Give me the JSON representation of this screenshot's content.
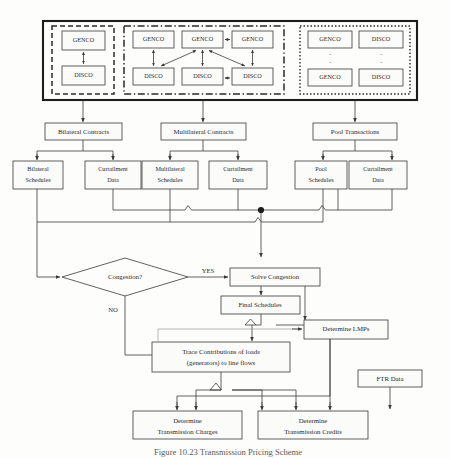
{
  "figure": {
    "caption": "Figure 10.23 Transmission Pricing Scheme",
    "background_color": "#fdfdfc",
    "line_color": "#3a3a3a",
    "box_fill": "#fbfbfa",
    "text_color": "#2a2a2a"
  },
  "top_panel": {
    "border_style": "solid-thick",
    "groups": [
      {
        "id": "bilateral-group",
        "border_style": "dashed",
        "nodes": [
          {
            "id": "bi-genco",
            "label": "GENCO"
          },
          {
            "id": "bi-disco",
            "label": "DISCO"
          }
        ]
      },
      {
        "id": "multilateral-group",
        "border_style": "dash-dot",
        "nodes": [
          {
            "id": "ml-genco-1",
            "label": "GENCO"
          },
          {
            "id": "ml-genco-2",
            "label": "GENCO"
          },
          {
            "id": "ml-genco-3",
            "label": "GENCO"
          },
          {
            "id": "ml-disco-1",
            "label": "DISCO"
          },
          {
            "id": "ml-disco-2",
            "label": "DISCO"
          },
          {
            "id": "ml-disco-3",
            "label": "DISCO"
          }
        ]
      },
      {
        "id": "pool-group",
        "border_style": "dotted",
        "vertical_ellipsis": ".",
        "nodes": [
          {
            "id": "pl-genco-1",
            "label": "GENCO"
          },
          {
            "id": "pl-disco-1",
            "label": "DISCO"
          },
          {
            "id": "pl-genco-2",
            "label": "GENCO"
          },
          {
            "id": "pl-disco-2",
            "label": "DISCO"
          }
        ]
      }
    ]
  },
  "contracts_row": [
    {
      "id": "bilateral-contracts",
      "label": "Bilateral Contracts"
    },
    {
      "id": "multilateral-contracts",
      "label": "Multilateral Contracts"
    },
    {
      "id": "pool-transactions",
      "label": "Pool Transactions"
    }
  ],
  "schedules_row": [
    {
      "id": "bilateral-schedules",
      "line1": "Bilateral",
      "line2": "Schedules"
    },
    {
      "id": "bilateral-curtailment",
      "line1": "Curtailment",
      "line2": "Data"
    },
    {
      "id": "multilateral-schedules",
      "line1": "Multilateral",
      "line2": "Schedules"
    },
    {
      "id": "multilateral-curtailment",
      "line1": "Curtailment",
      "line2": "Data"
    },
    {
      "id": "pool-schedules",
      "line1": "Pool",
      "line2": "Schedules"
    },
    {
      "id": "pool-curtailment",
      "line1": "Curtailment",
      "line2": "Data"
    }
  ],
  "decision": {
    "id": "congestion-decision",
    "label": "Congestion?",
    "yes_label": "YES",
    "no_label": "NO"
  },
  "process_nodes": [
    {
      "id": "solve-congestion",
      "label": "Solve Congestion"
    },
    {
      "id": "final-schedules",
      "label": "Final Schedules"
    },
    {
      "id": "determine-lmps",
      "label": "Determine LMPs"
    },
    {
      "id": "ftr-data",
      "label": "FTR  Data"
    }
  ],
  "trace_node": {
    "id": "trace-contributions",
    "line1": "Trace Contributions of loads",
    "line2": "(generators) to line flows"
  },
  "output_nodes": [
    {
      "id": "determine-transmission-charges",
      "line1": "Determine",
      "line2": "Transmission Charges"
    },
    {
      "id": "determine-transmission-credits",
      "line1": "Determine",
      "line2": "Transmission Credits"
    }
  ]
}
